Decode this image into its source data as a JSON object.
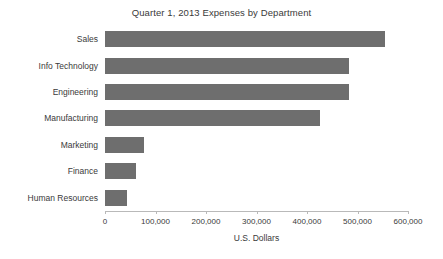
{
  "chart_data": {
    "type": "bar",
    "orientation": "horizontal",
    "title": "Quarter 1, 2013 Expenses by Department",
    "xlabel": "U.S. Dollars",
    "ylabel": "",
    "categories": [
      "Sales",
      "Info Technology",
      "Engineering",
      "Manufacturing",
      "Marketing",
      "Finance",
      "Human Resources"
    ],
    "values": [
      554000,
      483000,
      483000,
      425000,
      77000,
      61000,
      43000
    ],
    "xlim": [
      0,
      600000
    ],
    "xticks": [
      0,
      100000,
      200000,
      300000,
      400000,
      500000,
      600000
    ],
    "xtick_labels": [
      "0",
      "100,000",
      "200,000",
      "300,000",
      "400,000",
      "500,000",
      "600,000"
    ],
    "grid": false,
    "legend": false,
    "bar_color": "#6e6e6e",
    "axis_color": "#b9b9b9",
    "text_color": "#3a3a3a",
    "background": "#ffffff"
  }
}
